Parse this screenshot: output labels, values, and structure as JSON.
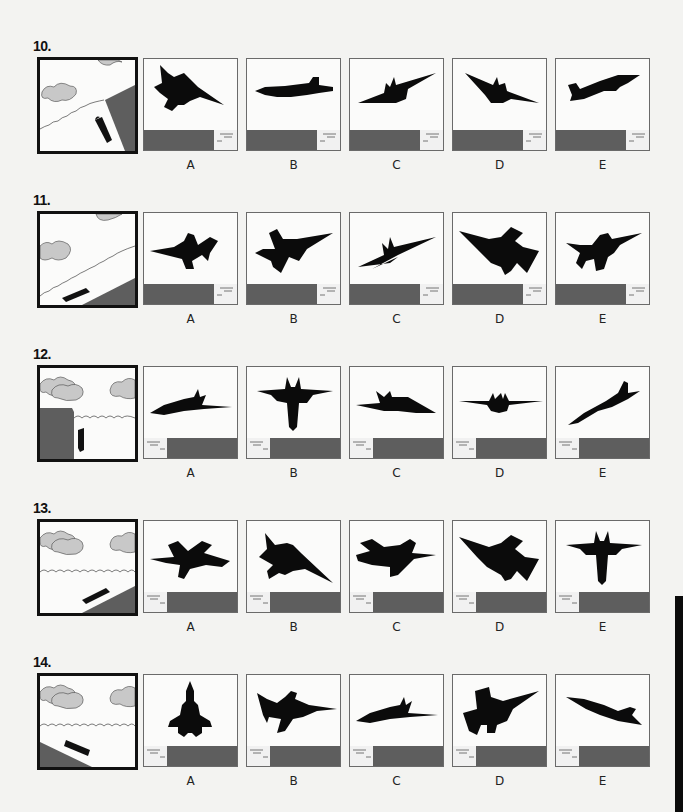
{
  "colors": {
    "background": "#f3f3f1",
    "ground": "#5e5e5e",
    "cloud": "#c8c8c8",
    "silhouette": "#0b0b0b",
    "frame": "#111111",
    "option_border": "#6a6a6a"
  },
  "option_labels": [
    "A",
    "B",
    "C",
    "D",
    "E"
  ],
  "problems": [
    {
      "number": "10.",
      "reference": "submarine-view: diagonal coastline upper-right, land bottom-right, clouds upper-left",
      "ground_inset_side": "right",
      "options": [
        {
          "label": "A",
          "aircraft": "F-16 banked, viewed from below, nose lower-right"
        },
        {
          "label": "B",
          "aircraft": "F/A-18 side profile, level, nose left"
        },
        {
          "label": "C",
          "aircraft": "F-14 head-on, banked left wing low"
        },
        {
          "label": "D",
          "aircraft": "F-14 head-on, banked right wing low"
        },
        {
          "label": "E",
          "aircraft": "F/A-18 side profile, climbing, nose upper-right"
        }
      ]
    },
    {
      "number": "11.",
      "reference": "diagonal coastline lower-right, clouds upper-left",
      "ground_inset_side": "right",
      "options": [
        {
          "label": "A",
          "aircraft": "F-16 side profile, level, nose left"
        },
        {
          "label": "B",
          "aircraft": "F-16 from below, banked, nose upper-right"
        },
        {
          "label": "C",
          "aircraft": "F-14 head-on, steep bank"
        },
        {
          "label": "D",
          "aircraft": "F-16 from below, banked, nose upper-left"
        },
        {
          "label": "E",
          "aircraft": "F-16 from below, banked, nose upper-right"
        }
      ]
    },
    {
      "number": "12.",
      "reference": "cliff on left, horizon level, clouds above, submarine vertical",
      "ground_inset_side": "left",
      "options": [
        {
          "label": "A",
          "aircraft": "F/A-18 side profile, nose left, slight climb"
        },
        {
          "label": "B",
          "aircraft": "F/A-18 from below, nose down"
        },
        {
          "label": "C",
          "aircraft": "F/A-18 side profile, nose right"
        },
        {
          "label": "D",
          "aircraft": "F-14 head-on, level"
        },
        {
          "label": "E",
          "aircraft": "F/A-18 side profile, climbing, nose lower-left"
        }
      ]
    },
    {
      "number": "13.",
      "reference": "level horizon, land bottom-right slope, submarine angled up-right",
      "ground_inset_side": "left",
      "options": [
        {
          "label": "A",
          "aircraft": "F/A-18 from above, banked"
        },
        {
          "label": "B",
          "aircraft": "F-16 from below, nose lower-right"
        },
        {
          "label": "C",
          "aircraft": "F/A-18 from above, banked, nose lower-left"
        },
        {
          "label": "D",
          "aircraft": "F-16 from below, nose upper-right"
        },
        {
          "label": "E",
          "aircraft": "F/A-18 from below, nose down"
        }
      ]
    },
    {
      "number": "14.",
      "reference": "level horizon, land bottom-left slope, submarine angled down-right",
      "ground_inset_side": "left",
      "options": [
        {
          "label": "A",
          "aircraft": "F-15 top view, nose up"
        },
        {
          "label": "B",
          "aircraft": "F-16 side profile, nose right"
        },
        {
          "label": "C",
          "aircraft": "F/A-18 side profile, nose right"
        },
        {
          "label": "D",
          "aircraft": "F-16 from below, nose upper-right"
        },
        {
          "label": "E",
          "aircraft": "F/A-18 side profile, diving, nose upper-left"
        }
      ]
    }
  ]
}
